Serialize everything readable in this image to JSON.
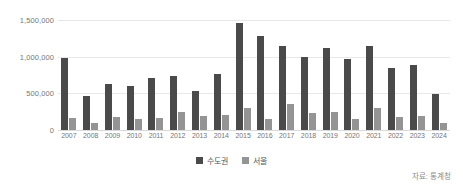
{
  "chart_data": {
    "type": "bar",
    "title": "",
    "subtitle": "",
    "xlabel": "",
    "ylabel": "",
    "ylim": [
      0,
      1500000
    ],
    "grid": true,
    "legend_position": "bottom-center",
    "categories": [
      "2007",
      "2008",
      "2009",
      "2010",
      "2011",
      "2012",
      "2013",
      "2014",
      "2015",
      "2016",
      "2017",
      "2018",
      "2019",
      "2020",
      "2021",
      "2022",
      "2023",
      "2024"
    ],
    "ytick_labels": [
      "1,500,000",
      "1,000,000",
      "500,000",
      "0"
    ],
    "ytick_values": [
      1500000,
      1000000,
      500000,
      0
    ],
    "series": [
      {
        "name": "수도권",
        "color": "#4a4a4a",
        "values": [
          980000,
          460000,
          630000,
          600000,
          710000,
          740000,
          530000,
          760000,
          1460000,
          1280000,
          1150000,
          1000000,
          1120000,
          965000,
          1140000,
          850000,
          880000,
          490000
        ]
      },
      {
        "name": "서울",
        "color": "#949494",
        "values": [
          170000,
          95000,
          175000,
          150000,
          160000,
          250000,
          195000,
          200000,
          300000,
          150000,
          360000,
          235000,
          250000,
          150000,
          300000,
          175000,
          195000,
          95000
        ]
      }
    ],
    "source_note": "자료: 통계청"
  },
  "legend": {
    "items": [
      {
        "label": "수도권",
        "color": "#4a4a4a"
      },
      {
        "label": "서울",
        "color": "#949494"
      }
    ]
  },
  "source": {
    "text": "자료: 통계청"
  },
  "colors": {
    "series_dark": "#4a4a4a",
    "series_light": "#949494",
    "gridline": "#e8e8e8",
    "axis_text": "#767676",
    "background": "#ffffff"
  }
}
